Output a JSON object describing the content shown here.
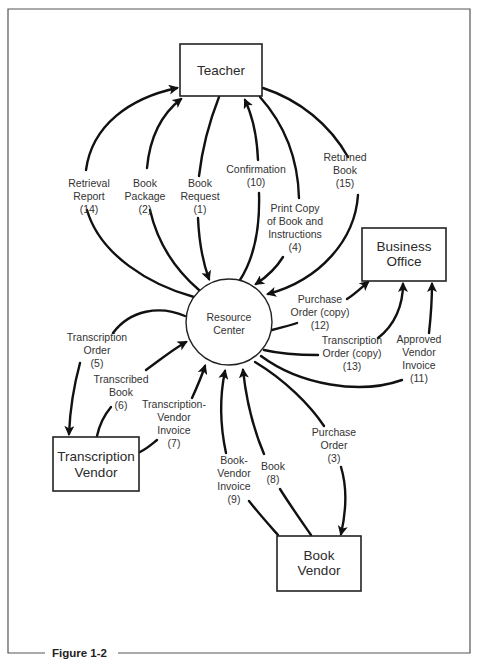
{
  "figure": {
    "caption": "Figure 1-2"
  },
  "nodes": {
    "teacher": {
      "lines": [
        "Teacher"
      ]
    },
    "resource_center": {
      "lines": [
        "Resource",
        "Center"
      ]
    },
    "business_office": {
      "lines": [
        "Business",
        "Office"
      ]
    },
    "transcription_vendor": {
      "lines": [
        "Transcription",
        "Vendor"
      ]
    },
    "book_vendor": {
      "lines": [
        "Book",
        "Vendor"
      ]
    }
  },
  "flows": {
    "retrieval_report": {
      "lines": [
        "Retrieval",
        "Report",
        "(14)"
      ],
      "from": "Resource Center",
      "to": "Teacher"
    },
    "book_package": {
      "lines": [
        "Book",
        "Package",
        "(2)"
      ],
      "from": "Resource Center",
      "to": "Teacher"
    },
    "book_request": {
      "lines": [
        "Book",
        "Request",
        "(1)"
      ],
      "from": "Teacher",
      "to": "Resource Center"
    },
    "confirmation": {
      "lines": [
        "Confirmation",
        "(10)"
      ],
      "from": "Resource Center",
      "to": "Teacher"
    },
    "print_copy": {
      "lines": [
        "Print Copy",
        "of Book and",
        "Instructions",
        "(4)"
      ],
      "from": "Teacher",
      "to": "Resource Center"
    },
    "returned_book": {
      "lines": [
        "Returned",
        "Book",
        "(15)"
      ],
      "from": "Teacher",
      "to": "Resource Center"
    },
    "purchase_order_copy": {
      "lines": [
        "Purchase",
        "Order (copy)",
        "(12)"
      ],
      "from": "Resource Center",
      "to": "Business Office"
    },
    "transcription_order_copy": {
      "lines": [
        "Transcription",
        "Order (copy)",
        "(13)"
      ],
      "from": "Resource Center",
      "to": "Business Office"
    },
    "approved_vendor_invoice": {
      "lines": [
        "Approved",
        "Vendor",
        "Invoice",
        "(11)"
      ],
      "from": "Resource Center",
      "to": "Business Office"
    },
    "transcription_order": {
      "lines": [
        "Transcription",
        "Order",
        "(5)"
      ],
      "from": "Resource Center",
      "to": "Transcription Vendor"
    },
    "transcribed_book": {
      "lines": [
        "Transcribed",
        "Book",
        "(6)"
      ],
      "from": "Transcription Vendor",
      "to": "Resource Center"
    },
    "transcription_vendor_invoice": {
      "lines": [
        "Transcription-",
        "Vendor",
        "Invoice",
        "(7)"
      ],
      "from": "Transcription Vendor",
      "to": "Resource Center"
    },
    "book_vendor_invoice": {
      "lines": [
        "Book-",
        "Vendor",
        "Invoice",
        "(9)"
      ],
      "from": "Book Vendor",
      "to": "Resource Center"
    },
    "book": {
      "lines": [
        "Book",
        "(8)"
      ],
      "from": "Book Vendor",
      "to": "Resource Center"
    },
    "purchase_order": {
      "lines": [
        "Purchase",
        "Order",
        "(3)"
      ],
      "from": "Resource Center",
      "to": "Book Vendor"
    }
  }
}
